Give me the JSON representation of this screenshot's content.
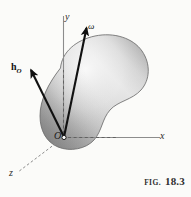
{
  "figure": {
    "caption_prefix": "FIG.",
    "caption_number": "18.3",
    "background_color": "#fbfbf9",
    "body_fill_light": "#f2f2f2",
    "body_fill_dark": "#9a9a9a",
    "body_outline_color": "#6e6e6e",
    "axis_color": "#8c8c8c",
    "vector_color": "#111111"
  },
  "axes": [
    {
      "name": "y-axis",
      "label": "y",
      "direction": "up"
    },
    {
      "name": "x-axis",
      "label": "x",
      "direction": "right"
    },
    {
      "name": "z-axis",
      "label": "z",
      "direction": "down-left"
    }
  ],
  "origin": {
    "label": "O",
    "marker": "open-circle"
  },
  "vectors": [
    {
      "name": "angular-momentum-vector",
      "label_bold": "h",
      "label_subscript": "O",
      "direction": "up-left"
    },
    {
      "name": "angular-velocity-vector",
      "label": "ω",
      "direction": "up-right"
    }
  ],
  "body": {
    "name": "rigid-body-blob",
    "shape": "kidney-shaped solid"
  },
  "construction_lines": [
    {
      "name": "y-projection-dashed-line",
      "style": "dashed"
    },
    {
      "name": "x-projection-dashed-line",
      "style": "dashed"
    },
    {
      "name": "z-projection-dashed-line",
      "style": "dashed"
    }
  ]
}
